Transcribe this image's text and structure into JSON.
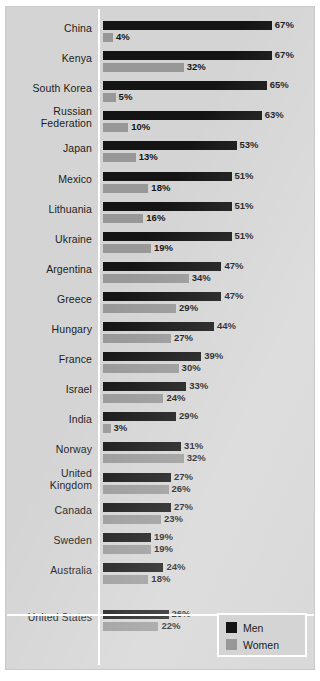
{
  "chart_data": {
    "type": "bar",
    "orientation": "horizontal",
    "title": "",
    "xlabel": "",
    "ylabel": "",
    "xlim": [
      0,
      70
    ],
    "grid": false,
    "legend_position": "bottom-right",
    "value_suffix": "%",
    "categories": [
      "China",
      "Kenya",
      "South Korea",
      "Russian Federation",
      "Japan",
      "Mexico",
      "Lithuania",
      "Ukraine",
      "Argentina",
      "Greece",
      "Hungary",
      "France",
      "Israel",
      "India",
      "Norway",
      "United Kingdom",
      "Canada",
      "Sweden",
      "Australia",
      "United States"
    ],
    "series": [
      {
        "name": "Men",
        "color": "#141414",
        "values": [
          67,
          67,
          65,
          63,
          53,
          51,
          51,
          51,
          47,
          47,
          44,
          39,
          33,
          29,
          31,
          27,
          27,
          19,
          24,
          26
        ]
      },
      {
        "name": "Women",
        "color": "#989898",
        "values": [
          4,
          32,
          5,
          10,
          13,
          18,
          16,
          19,
          34,
          29,
          27,
          30,
          24,
          3,
          32,
          26,
          23,
          19,
          18,
          22
        ]
      }
    ]
  },
  "rows": [
    {
      "label": "China",
      "label_lines": [
        "China"
      ],
      "men": "67%",
      "women": "4%"
    },
    {
      "label": "Kenya",
      "label_lines": [
        "Kenya"
      ],
      "men": "67%",
      "women": "32%"
    },
    {
      "label": "South Korea",
      "label_lines": [
        "South Korea"
      ],
      "men": "65%",
      "women": "5%"
    },
    {
      "label": "Russian Federation",
      "label_lines": [
        "Russian",
        "Federation"
      ],
      "men": "63%",
      "women": "10%"
    },
    {
      "label": "Japan",
      "label_lines": [
        "Japan"
      ],
      "men": "53%",
      "women": "13%"
    },
    {
      "label": "Mexico",
      "label_lines": [
        "Mexico"
      ],
      "men": "51%",
      "women": "18%"
    },
    {
      "label": "Lithuania",
      "label_lines": [
        "Lithuania"
      ],
      "men": "51%",
      "women": "16%"
    },
    {
      "label": "Ukraine",
      "label_lines": [
        "Ukraine"
      ],
      "men": "51%",
      "women": "19%"
    },
    {
      "label": "Argentina",
      "label_lines": [
        "Argentina"
      ],
      "men": "47%",
      "women": "34%"
    },
    {
      "label": "Greece",
      "label_lines": [
        "Greece"
      ],
      "men": "47%",
      "women": "29%"
    },
    {
      "label": "Hungary",
      "label_lines": [
        "Hungary"
      ],
      "men": "44%",
      "women": "27%"
    },
    {
      "label": "France",
      "label_lines": [
        "France"
      ],
      "men": "39%",
      "women": "30%"
    },
    {
      "label": "Israel",
      "label_lines": [
        "Israel"
      ],
      "men": "33%",
      "women": "24%"
    },
    {
      "label": "India",
      "label_lines": [
        "India"
      ],
      "men": "29%",
      "women": "3%"
    },
    {
      "label": "Norway",
      "label_lines": [
        "Norway"
      ],
      "men": "31%",
      "women": "32%"
    },
    {
      "label": "United Kingdom",
      "label_lines": [
        "United",
        "Kingdom"
      ],
      "men": "27%",
      "women": "26%"
    },
    {
      "label": "Canada",
      "label_lines": [
        "Canada"
      ],
      "men": "27%",
      "women": "23%"
    },
    {
      "label": "Sweden",
      "label_lines": [
        "Sweden"
      ],
      "men": "19%",
      "women": "19%"
    },
    {
      "label": "Australia",
      "label_lines": [
        "Australia"
      ],
      "men": "24%",
      "women": "18%"
    },
    {
      "label": "United States",
      "label_lines": [
        "United States"
      ],
      "men": "26%",
      "women": "22%"
    }
  ],
  "legend": {
    "items": [
      {
        "label": "Men",
        "color": "#141414"
      },
      {
        "label": "Women",
        "color": "#989898"
      }
    ]
  },
  "style": {
    "background": "#d4d4d4",
    "men_color": "#141414",
    "women_color": "#989898",
    "axis_color": "#ffffff"
  }
}
